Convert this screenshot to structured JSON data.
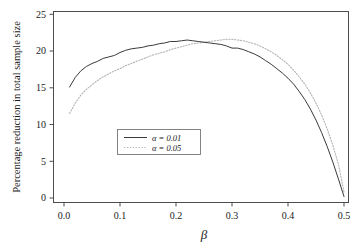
{
  "chart_data": {
    "type": "line",
    "title": "",
    "xlabel": "β",
    "ylabel": "Percentage reduction in total sample size",
    "xlim": [
      0.0,
      0.5
    ],
    "ylim": [
      0,
      26
    ],
    "grid": false,
    "legend_position": "center-left",
    "x_ticks": [
      "0.0",
      "0.1",
      "0.2",
      "0.3",
      "0.4",
      "0.5"
    ],
    "x_tick_values": [
      0.0,
      0.1,
      0.2,
      0.3,
      0.4,
      0.5
    ],
    "y_ticks": [
      "0",
      "5",
      "10",
      "15",
      "20",
      "25"
    ],
    "y_tick_values": [
      0,
      5,
      10,
      15,
      20,
      25
    ],
    "x": [
      0.01,
      0.02,
      0.03,
      0.04,
      0.05,
      0.06,
      0.07,
      0.08,
      0.09,
      0.1,
      0.11,
      0.12,
      0.13,
      0.14,
      0.15,
      0.16,
      0.17,
      0.18,
      0.19,
      0.2,
      0.21,
      0.22,
      0.23,
      0.24,
      0.25,
      0.26,
      0.27,
      0.28,
      0.29,
      0.3,
      0.31,
      0.32,
      0.33,
      0.34,
      0.35,
      0.36,
      0.37,
      0.38,
      0.39,
      0.4,
      0.41,
      0.42,
      0.43,
      0.44,
      0.45,
      0.46,
      0.47,
      0.48,
      0.49,
      0.5
    ],
    "series": [
      {
        "name": "α = 0.01",
        "line_style": "solid",
        "color": "#3a3a3a",
        "values": [
          15.1,
          16.4,
          17.3,
          17.9,
          18.3,
          18.6,
          19.0,
          19.2,
          19.4,
          19.8,
          20.1,
          20.3,
          20.4,
          20.5,
          20.7,
          20.8,
          21.0,
          21.1,
          21.3,
          21.3,
          21.4,
          21.5,
          21.4,
          21.3,
          21.2,
          21.1,
          21.0,
          20.9,
          20.7,
          20.4,
          20.4,
          20.2,
          19.9,
          19.6,
          19.2,
          18.7,
          18.2,
          17.6,
          17.0,
          16.3,
          15.5,
          14.5,
          13.4,
          12.1,
          10.6,
          8.9,
          7.0,
          4.9,
          2.6,
          0.2
        ]
      },
      {
        "name": "α = 0.05",
        "line_style": "dotted",
        "color": "#b4b4b4",
        "values": [
          11.5,
          12.9,
          14.0,
          14.8,
          15.4,
          16.0,
          16.5,
          16.9,
          17.3,
          17.6,
          18.0,
          18.3,
          18.6,
          18.9,
          19.2,
          19.5,
          19.7,
          19.9,
          20.2,
          20.4,
          20.6,
          20.8,
          21.0,
          21.1,
          21.2,
          21.3,
          21.4,
          21.5,
          21.6,
          21.6,
          21.5,
          21.4,
          21.2,
          21.0,
          20.7,
          20.3,
          19.9,
          19.4,
          18.8,
          18.2,
          17.4,
          16.5,
          15.5,
          14.3,
          12.9,
          11.3,
          9.4,
          7.2,
          4.6,
          0.8
        ]
      }
    ],
    "legend": {
      "entries": [
        {
          "label": "α = 0.01",
          "symbol": "solid-line"
        },
        {
          "label": "α = 0.05",
          "symbol": "dotted-line"
        }
      ]
    }
  }
}
